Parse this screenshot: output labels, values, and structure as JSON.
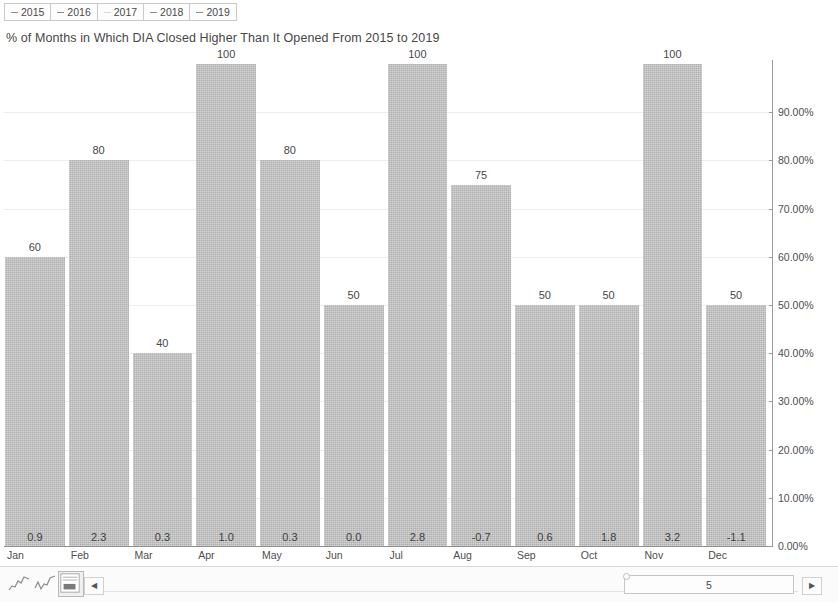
{
  "legend": {
    "items": [
      {
        "label": "2015",
        "marker": "dash-line-marker"
      },
      {
        "label": "2016",
        "marker": "dash-line-marker"
      },
      {
        "label": "2017",
        "marker": "dash-line-marker-faint"
      },
      {
        "label": "2018",
        "marker": "dash-line-marker"
      },
      {
        "label": "2019",
        "marker": "dash-line-marker"
      }
    ]
  },
  "chart_data": {
    "type": "bar",
    "title": "% of Months in Which DIA Closed Higher Than It Opened From 2015 to 2019",
    "xlabel": "",
    "ylabel": "",
    "ylim": [
      0,
      100
    ],
    "grid": true,
    "legend_position": "top-left",
    "categories": [
      "Jan",
      "Feb",
      "Mar",
      "Apr",
      "May",
      "Jun",
      "Jul",
      "Aug",
      "Sep",
      "Oct",
      "Nov",
      "Dec"
    ],
    "values": [
      60,
      80,
      40,
      100,
      80,
      50,
      100,
      75,
      50,
      50,
      100,
      50
    ],
    "bar_top_labels": [
      "60",
      "80",
      "40",
      "100",
      "80",
      "50",
      "100",
      "75",
      "50",
      "50",
      "100",
      "50"
    ],
    "bar_inner_labels": [
      "0.9",
      "2.3",
      "0.3",
      "1.0",
      "0.3",
      "0.0",
      "2.8",
      "-0.7",
      "0.6",
      "1.8",
      "3.2",
      "-1.1"
    ],
    "yticks": [
      0,
      10,
      20,
      30,
      40,
      50,
      60,
      70,
      80,
      90
    ],
    "ytick_labels": [
      "0.00%",
      "10.00%",
      "20.00%",
      "30.00%",
      "40.00%",
      "50.00%",
      "60.00%",
      "70.00%",
      "80.00%",
      "90.00%"
    ],
    "bar_color": "#c2c2c2",
    "gridline_color": "#ededed",
    "axis_color": "#8f8f8f"
  },
  "bottom_bar": {
    "sheet_tabs": [
      {
        "name": "line-chart-thumbnail-1",
        "active": false
      },
      {
        "name": "line-chart-thumbnail-2",
        "active": false
      },
      {
        "name": "bar-chart-thumbnail-3",
        "active": true
      }
    ],
    "scroll_left_label": "◀",
    "scroll_right_label": "▶",
    "scroll_thumb_value": "5"
  }
}
